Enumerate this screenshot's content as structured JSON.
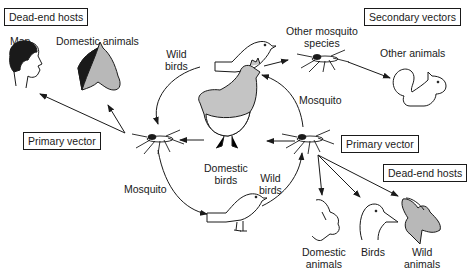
{
  "boxes": {
    "dead_end_hosts_left": "Dead-end hosts",
    "secondary_vectors": "Secondary vectors",
    "primary_vector_left": "Primary vector",
    "primary_vector_right": "Primary vector",
    "dead_end_hosts_right": "Dead-end hosts"
  },
  "labels": {
    "man": "Man",
    "domestic_animals_top": "Domestic animals",
    "wild_birds_top_1": "Wild",
    "wild_birds_top_2": "birds",
    "other_mosquito_1": "Other mosquito",
    "other_mosquito_2": "species",
    "other_animals": "Other animals",
    "mosquito_right": "Mosquito",
    "domestic_birds_1": "Domestic",
    "domestic_birds_2": "birds",
    "mosquito_left": "Mosquito",
    "wild_birds_bottom_1": "Wild",
    "wild_birds_bottom_2": "birds",
    "domestic_animals_bottom_1": "Domestic",
    "domestic_animals_bottom_2": "animals",
    "birds_bottom": "Birds",
    "wild_animals_1": "Wild",
    "wild_animals_2": "animals"
  },
  "colors": {
    "line": "#1a1a1a",
    "fill_gray": "#b8b8b8"
  }
}
